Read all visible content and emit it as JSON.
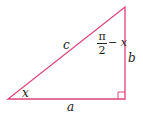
{
  "diagram": {
    "type": "right-triangle",
    "stroke_color": "#e0427a",
    "vertices": {
      "bottom_left": [
        8,
        99
      ],
      "bottom_right": [
        125,
        99
      ],
      "top": [
        125,
        7
      ]
    },
    "labels": {
      "hypotenuse": "c",
      "adjacent": "a",
      "opposite": "b",
      "angle_bottom_left": "x",
      "angle_top_num": "π",
      "angle_top_den": "2",
      "angle_top_suffix": "− x"
    },
    "right_angle_marker": true
  }
}
